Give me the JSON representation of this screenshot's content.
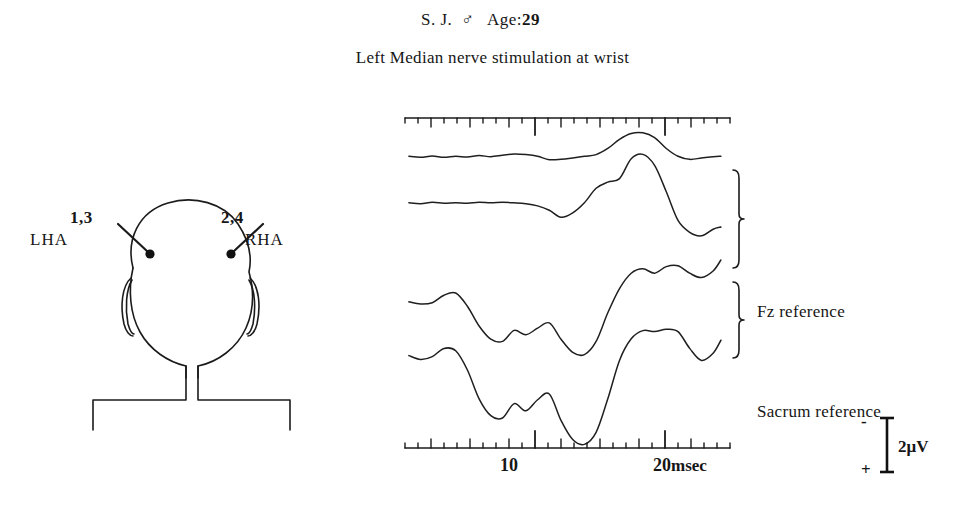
{
  "header": {
    "subject_initials": "S. J.",
    "sex_symbol": "♂",
    "age_label": "Age:",
    "age_value": "29",
    "stimulation_line": "Left Median nerve stimulation at wrist"
  },
  "head_diagram": {
    "left_electrode_numbers": "1,3",
    "left_electrode_label": "LHA",
    "right_electrode_numbers": "2,4",
    "right_electrode_label": "RHA"
  },
  "groups": {
    "fz_label": "Fz reference",
    "sacrum_label": "Sacrum reference"
  },
  "calibration": {
    "amplitude_label": "2μV",
    "negative_sign": "-",
    "positive_sign": "+"
  },
  "axis": {
    "tick_10_label": "10",
    "tick_20_label": "20",
    "unit_label": "msec",
    "xmin_msec": 0,
    "xmax_msec": 25,
    "major_ticks_msec": [
      10,
      20
    ],
    "medium_ticks_msec": [
      2,
      5,
      8,
      12,
      15,
      18,
      22
    ],
    "minor_tick_interval_msec": 1
  },
  "chart_data": {
    "type": "line",
    "title": "Left Median nerve stimulation at wrist",
    "xlabel": "msec",
    "ylabel": "2μV",
    "xlim": [
      0,
      25
    ],
    "grid": false,
    "legend_position": "right",
    "series": [
      {
        "name": "LHA – Fz reference (trace 1)",
        "reference": "Fz reference",
        "x": [
          0.3,
          1.2,
          2.1,
          3.0,
          3.9,
          4.8,
          5.7,
          6.6,
          7.5,
          8.4,
          9.3,
          10.2,
          11.1,
          12.0,
          12.9,
          13.8,
          14.7,
          15.6,
          16.5,
          17.4,
          18.3,
          19.2,
          20.1,
          21.0,
          21.9,
          22.8,
          23.7,
          24.3
        ],
        "values": [
          0.05,
          0.02,
          0.06,
          0.02,
          0.05,
          0.03,
          0.07,
          0.04,
          0.08,
          0.12,
          0.1,
          0.05,
          -0.05,
          -0.04,
          0.0,
          0.05,
          0.1,
          0.28,
          0.55,
          0.72,
          0.74,
          0.6,
          0.28,
          0.05,
          -0.04,
          0.0,
          0.04,
          0.05
        ]
      },
      {
        "name": "RHA – Fz reference (trace 2)",
        "reference": "Fz reference",
        "x": [
          0.3,
          1.2,
          2.1,
          3.0,
          3.9,
          4.8,
          5.7,
          6.6,
          7.5,
          8.4,
          9.3,
          10.2,
          11.1,
          12.0,
          12.9,
          13.8,
          14.7,
          15.6,
          16.5,
          17.4,
          18.3,
          19.2,
          20.1,
          21.0,
          21.9,
          22.8,
          23.7,
          24.3
        ],
        "values": [
          0.05,
          0.03,
          0.06,
          0.04,
          0.05,
          0.04,
          0.06,
          0.05,
          0.06,
          0.05,
          0.03,
          -0.02,
          -0.12,
          -0.28,
          -0.18,
          0.05,
          0.38,
          0.52,
          0.6,
          1.05,
          1.15,
          0.9,
          0.3,
          -0.35,
          -0.62,
          -0.7,
          -0.55,
          -0.5
        ]
      },
      {
        "name": "LHA – Sacrum reference (trace 3)",
        "reference": "Sacrum reference",
        "x": [
          0.3,
          1.2,
          2.1,
          3.0,
          3.9,
          4.8,
          5.7,
          6.6,
          7.5,
          8.4,
          9.3,
          10.2,
          11.1,
          12.0,
          12.9,
          13.8,
          14.7,
          15.6,
          16.5,
          17.4,
          18.3,
          19.2,
          20.1,
          21.0,
          21.9,
          22.8,
          23.7,
          24.3
        ],
        "values": [
          0.3,
          0.25,
          0.28,
          0.45,
          0.5,
          0.2,
          -0.25,
          -0.55,
          -0.6,
          -0.35,
          -0.45,
          -0.3,
          -0.18,
          -0.55,
          -0.85,
          -0.9,
          -0.6,
          0.05,
          0.6,
          0.95,
          1.05,
          0.95,
          1.1,
          1.12,
          0.95,
          0.85,
          1.0,
          1.25
        ]
      },
      {
        "name": "RHA – Sacrum reference (trace 4)",
        "reference": "Sacrum reference",
        "x": [
          0.3,
          1.2,
          2.1,
          3.0,
          3.9,
          4.8,
          5.7,
          6.6,
          7.5,
          8.4,
          9.3,
          10.2,
          11.1,
          12.0,
          12.9,
          13.8,
          14.7,
          15.6,
          16.5,
          17.4,
          18.3,
          19.2,
          20.1,
          21.0,
          21.9,
          22.8,
          23.7,
          24.3
        ],
        "values": [
          0.3,
          0.22,
          0.28,
          0.45,
          0.4,
          0.0,
          -0.6,
          -0.95,
          -1.0,
          -0.7,
          -0.85,
          -0.62,
          -0.5,
          -1.05,
          -1.45,
          -1.55,
          -1.3,
          -0.6,
          0.2,
          0.65,
          0.82,
          0.8,
          0.85,
          0.8,
          0.45,
          0.2,
          0.35,
          0.62
        ]
      }
    ]
  }
}
